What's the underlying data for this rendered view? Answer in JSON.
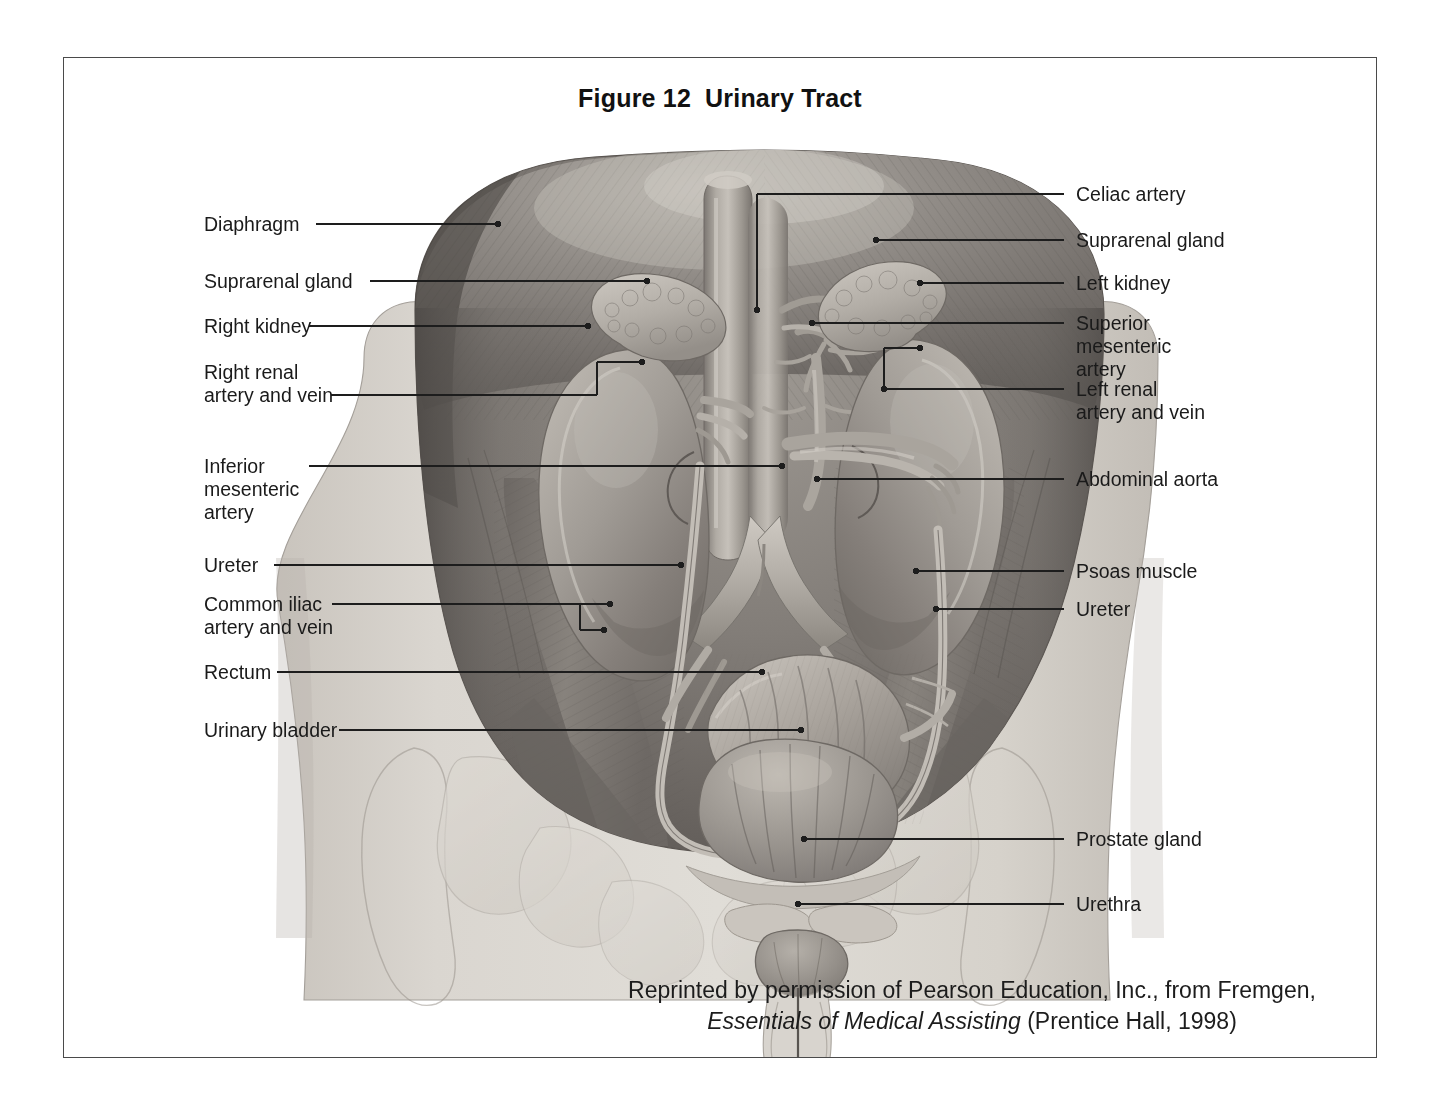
{
  "figure": {
    "number": "Figure 12",
    "title": "Urinary Tract"
  },
  "labels_left": [
    {
      "text": "Diaphragm",
      "name": "label-diaphragm"
    },
    {
      "text": "Suprarenal gland",
      "name": "label-suprarenal-gland-left-col"
    },
    {
      "text": "Right kidney",
      "name": "label-right-kidney"
    },
    {
      "text": "Right renal\nartery and vein",
      "name": "label-right-renal-artery-and-vein"
    },
    {
      "text": "Inferior\nmesenteric\nartery",
      "name": "label-inferior-mesenteric-artery"
    },
    {
      "text": "Ureter",
      "name": "label-ureter-left-col"
    },
    {
      "text": "Common iliac\nartery and vein",
      "name": "label-common-iliac-artery-and-vein"
    },
    {
      "text": "Rectum",
      "name": "label-rectum"
    },
    {
      "text": "Urinary bladder",
      "name": "label-urinary-bladder"
    }
  ],
  "labels_right": [
    {
      "text": "Celiac artery",
      "name": "label-celiac-artery"
    },
    {
      "text": "Suprarenal gland",
      "name": "label-suprarenal-gland-right-col"
    },
    {
      "text": "Left kidney",
      "name": "label-left-kidney"
    },
    {
      "text": "Superior\nmesenteric\nartery",
      "name": "label-superior-mesenteric-artery"
    },
    {
      "text": "Left renal\nartery and vein",
      "name": "label-left-renal-artery-and-vein"
    },
    {
      "text": "Abdominal aorta",
      "name": "label-abdominal-aorta"
    },
    {
      "text": "Psoas muscle",
      "name": "label-psoas-muscle"
    },
    {
      "text": "Ureter",
      "name": "label-ureter-right-col"
    },
    {
      "text": "Prostate gland",
      "name": "label-prostate-gland"
    },
    {
      "text": "Urethra",
      "name": "label-urethra"
    }
  ],
  "credit": {
    "line1": "Reprinted by permission of Pearson Education, Inc., from Fremgen,",
    "line2_title": "Essentials of Medical Assisting",
    "line2_rest": " (Prentice Hall, 1998)"
  },
  "colors": {
    "frame_border": "#4a4a4a",
    "text": "#1a1a1a",
    "leader_line": "#1d1d1d",
    "page_background": "#ffffff",
    "skin_light": "#d2cec8",
    "cavity_dark": "#6f6b68",
    "kidney": "#9b9690",
    "organ_mid": "#a9a49e",
    "vessel_light": "#c4bfb8"
  }
}
